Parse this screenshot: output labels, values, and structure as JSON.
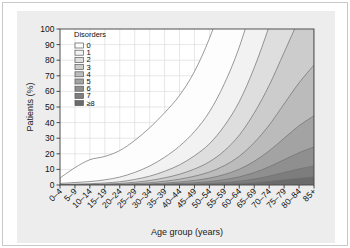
{
  "figure": {
    "background_color": "#ededed",
    "page_color": "#ffffff",
    "frame_color": "#c8c8c8"
  },
  "chart_data": {
    "type": "area",
    "title": "",
    "subtitle": "",
    "xlabel": "Age group (years)",
    "ylabel": "Patients (%)",
    "xlim": [
      0,
      17
    ],
    "ylim": [
      0,
      100
    ],
    "yticks": [
      0,
      10,
      20,
      30,
      40,
      50,
      60,
      70,
      80,
      90,
      100
    ],
    "grid": true,
    "stacked": true,
    "legend_title": "Disorders",
    "legend_position": "top-left-inside",
    "categories": [
      "0–4",
      "5–9",
      "10–14",
      "15–19",
      "20–24",
      "25–29",
      "30–34",
      "35–39",
      "40–44",
      "45–49",
      "50–54",
      "55–59",
      "60–64",
      "65–69",
      "70–74",
      "75–79",
      "80–84",
      "85+"
    ],
    "series": [
      {
        "name": "0",
        "color": "#fdfdfd",
        "values": [
          3.5,
          9.5,
          14.0,
          15.0,
          17.0,
          20.5,
          24.5,
          28.5,
          32.5,
          38.5,
          47.0,
          56.0,
          65.0,
          73.5,
          81.0,
          87.0,
          91.0,
          93.5
        ]
      },
      {
        "name": "1",
        "color": "#f2f2f2",
        "values": [
          0.6,
          1.0,
          1.4,
          2.0,
          3.0,
          4.5,
          6.5,
          9.0,
          12.0,
          15.5,
          20.5,
          27.0,
          35.0,
          44.5,
          55.0,
          65.0,
          73.5,
          81.5
        ]
      },
      {
        "name": "2",
        "color": "#dedede",
        "values": [
          0.2,
          0.3,
          0.4,
          0.7,
          1.1,
          1.8,
          2.8,
          4.2,
          6.0,
          8.5,
          11.5,
          16.0,
          21.5,
          29.0,
          38.0,
          47.5,
          56.5,
          64.0
        ]
      },
      {
        "name": "3",
        "color": "#cccccc",
        "values": [
          0.1,
          0.15,
          0.2,
          0.3,
          0.5,
          0.9,
          1.4,
          2.2,
          3.2,
          4.6,
          6.6,
          9.5,
          13.5,
          19.0,
          25.5,
          33.0,
          40.5,
          47.0
        ]
      },
      {
        "name": "4",
        "color": "#bbbbbb",
        "values": [
          0.05,
          0.08,
          0.1,
          0.15,
          0.25,
          0.45,
          0.75,
          1.2,
          1.8,
          2.7,
          3.9,
          5.7,
          8.3,
          12.0,
          16.5,
          22.0,
          27.5,
          32.5
        ]
      },
      {
        "name": "5",
        "color": "#a3a3a3",
        "values": [
          0.02,
          0.04,
          0.05,
          0.08,
          0.12,
          0.22,
          0.38,
          0.62,
          0.98,
          1.5,
          2.2,
          3.3,
          4.9,
          7.2,
          10.2,
          13.8,
          17.3,
          20.0
        ]
      },
      {
        "name": "6",
        "color": "#8f8f8f",
        "values": [
          0.01,
          0.02,
          0.03,
          0.04,
          0.06,
          0.11,
          0.19,
          0.32,
          0.52,
          0.8,
          1.2,
          1.85,
          2.8,
          4.2,
          6.0,
          8.2,
          10.4,
          12.2
        ]
      },
      {
        "name": "7",
        "color": "#7d7d7d",
        "values": [
          0.005,
          0.01,
          0.015,
          0.02,
          0.03,
          0.05,
          0.09,
          0.16,
          0.26,
          0.41,
          0.63,
          0.98,
          1.5,
          2.3,
          3.4,
          4.7,
          6.0,
          7.0
        ]
      },
      {
        "name": "≥8",
        "color": "#6b6b6b",
        "values": [
          0.002,
          0.005,
          0.008,
          0.012,
          0.018,
          0.03,
          0.05,
          0.09,
          0.15,
          0.24,
          0.38,
          0.6,
          0.95,
          1.5,
          2.3,
          3.3,
          4.3,
          5.2
        ]
      }
    ]
  }
}
